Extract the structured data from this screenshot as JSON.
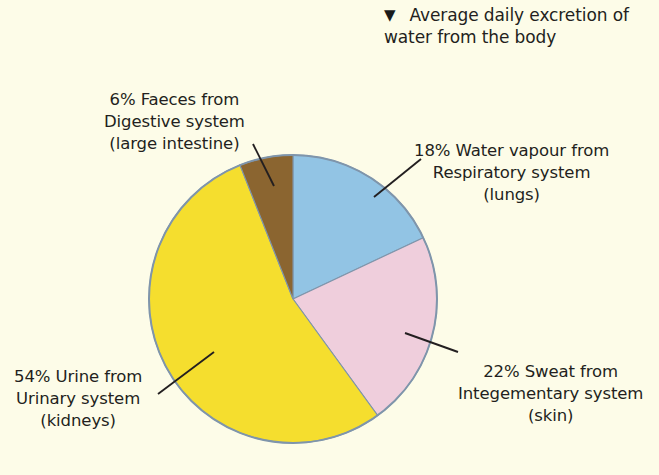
{
  "caption": {
    "marker_icon": "triangle-down-icon",
    "marker_glyph": "▼",
    "line1": "Average daily excretion of",
    "line2": "water from the body"
  },
  "background_color": "#fdfce8",
  "outline_color": "#7f95ab",
  "leader_line_color": "#231f20",
  "labels": {
    "faeces": {
      "line1": "6% Faeces from",
      "line2": "Digestive system",
      "line3": "(large intestine)"
    },
    "vapour": {
      "line1": "18% Water vapour from",
      "line2": "Respiratory system",
      "line3": "(lungs)"
    },
    "sweat": {
      "line1": "22% Sweat from",
      "line2": "Integementary system",
      "line3": "(skin)"
    },
    "urine": {
      "line1": "54% Urine from",
      "line2": "Urinary system",
      "line3": "(kidneys)"
    }
  },
  "chart_data": {
    "type": "pie",
    "title": "Average daily excretion of water from the body",
    "xlabel": "",
    "ylabel": "",
    "legend_position": "none",
    "grid": false,
    "start_angle_deg": 0,
    "direction": "clockwise",
    "center": {
      "x": 293,
      "y": 299
    },
    "radius": 144,
    "categories": [
      "18% Water vapour from Respiratory system (lungs)",
      "22% Sweat from Integementary system (skin)",
      "54% Urine from Urinary system (kidneys)",
      "6% Faeces from Digestive system (large intestine)"
    ],
    "values": [
      18,
      22,
      54,
      6
    ],
    "slices": [
      {
        "key": "vapour",
        "label": "Water vapour",
        "system": "Respiratory system",
        "organ": "lungs",
        "value": 18,
        "unit": "%",
        "color": "#92c4e4"
      },
      {
        "key": "sweat",
        "label": "Sweat",
        "system": "Integementary system",
        "organ": "skin",
        "value": 22,
        "unit": "%",
        "color": "#efcedc"
      },
      {
        "key": "urine",
        "label": "Urine",
        "system": "Urinary system",
        "organ": "kidneys",
        "value": 54,
        "unit": "%",
        "color": "#f5de2e"
      },
      {
        "key": "faeces",
        "label": "Faeces",
        "system": "Digestive system",
        "organ": "large intestine",
        "value": 6,
        "unit": "%",
        "color": "#8b6530"
      }
    ]
  }
}
